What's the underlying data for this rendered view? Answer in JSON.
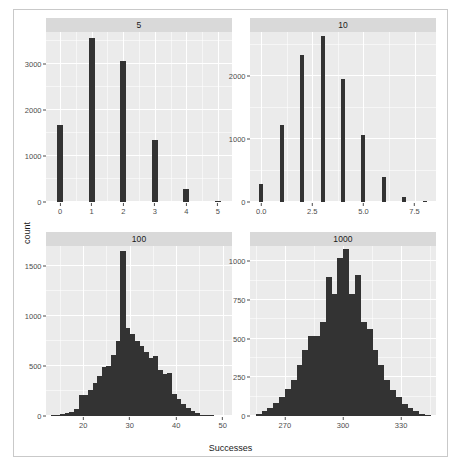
{
  "chart_data": {
    "type": "bar",
    "title": "",
    "xlabel": "Successes",
    "ylabel": "count",
    "grid": true,
    "legend": false,
    "facet_layout": "2x2",
    "facet_variable": "Trials",
    "panels": [
      {
        "strip_label": "5",
        "position": "top-left",
        "xlabel": "Successes",
        "ylabel": "count",
        "xlim": [
          -0.45,
          5.45
        ],
        "ylim": [
          0,
          3700
        ],
        "xticks": [
          "0",
          "1",
          "2",
          "3",
          "4",
          "5"
        ],
        "xtick_values": [
          0,
          1,
          2,
          3,
          4,
          5
        ],
        "yticks": [
          "0",
          "1000",
          "2000",
          "3000"
        ],
        "ytick_values": [
          0,
          1000,
          2000,
          3000
        ],
        "categories": [
          0,
          1,
          2,
          3,
          4,
          5
        ],
        "values": [
          1680,
          3570,
          3080,
          1340,
          290,
          25
        ]
      },
      {
        "strip_label": "10",
        "position": "top-right",
        "xlabel": "Successes",
        "ylabel": "count",
        "xlim": [
          -0.55,
          8.55
        ],
        "ylim": [
          0,
          2700
        ],
        "xticks": [
          "0.0",
          "2.5",
          "5.0",
          "7.5"
        ],
        "xtick_values": [
          0,
          2.5,
          5,
          7.5
        ],
        "yticks": [
          "0",
          "1000",
          "2000"
        ],
        "ytick_values": [
          0,
          1000,
          2000
        ],
        "categories": [
          0,
          1,
          2,
          3,
          4,
          5,
          6,
          7,
          8
        ],
        "values": [
          290,
          1230,
          2340,
          2630,
          1960,
          1060,
          400,
          80,
          15
        ]
      },
      {
        "strip_label": "100",
        "position": "bottom-left",
        "xlabel": "Successes",
        "ylabel": "count",
        "xlim": [
          12,
          52
        ],
        "ylim": [
          0,
          1700
        ],
        "xticks": [
          "20",
          "30",
          "40",
          "50"
        ],
        "xtick_values": [
          20,
          30,
          40,
          50
        ],
        "yticks": [
          "0",
          "500",
          "1000",
          "1500"
        ],
        "ytick_values": [
          0,
          500,
          1000,
          1500
        ],
        "bin_starts": [
          13,
          14,
          15,
          16,
          17,
          18,
          19,
          20,
          21,
          22,
          23,
          24,
          25,
          26,
          27,
          28,
          29,
          30,
          31,
          32,
          33,
          34,
          35,
          36,
          37,
          38,
          39,
          40,
          41,
          42,
          43,
          44,
          45,
          46,
          47
        ],
        "bin_width": 1,
        "values": [
          5,
          10,
          20,
          30,
          45,
          75,
          210,
          215,
          265,
          330,
          400,
          490,
          505,
          610,
          755,
          1650,
          880,
          820,
          755,
          700,
          640,
          580,
          600,
          460,
          420,
          430,
          225,
          175,
          120,
          80,
          55,
          30,
          15,
          8,
          4
        ]
      },
      {
        "strip_label": "1000",
        "position": "bottom-right",
        "xlabel": "Successes",
        "ylabel": "count",
        "xlim": [
          252,
          348
        ],
        "ylim": [
          0,
          1100
        ],
        "xticks": [
          "270",
          "300",
          "330"
        ],
        "xtick_values": [
          270,
          300,
          330
        ],
        "yticks": [
          "0",
          "250",
          "500",
          "750",
          "1000"
        ],
        "ytick_values": [
          0,
          250,
          500,
          750,
          1000
        ],
        "bin_starts": [
          255,
          258,
          261,
          264,
          267,
          270,
          273,
          276,
          279,
          282,
          285,
          288,
          291,
          294,
          297,
          300,
          303,
          306,
          309,
          312,
          315,
          318,
          321,
          324,
          327,
          330,
          333,
          336,
          339,
          342
        ],
        "bin_width": 3,
        "values": [
          15,
          30,
          55,
          85,
          120,
          175,
          230,
          330,
          430,
          520,
          520,
          610,
          900,
          790,
          1020,
          1080,
          790,
          910,
          610,
          560,
          430,
          330,
          235,
          170,
          120,
          80,
          50,
          30,
          15,
          8
        ]
      }
    ]
  },
  "colors": {
    "bar": "#333333",
    "panel_background": "#ebebeb",
    "strip_background": "#d9d9d9",
    "gridline": "#ffffff",
    "axis_text": "#4d4d4d",
    "title_text": "#1a1a1a",
    "figure_background": "#ffffff",
    "figure_border": "#c9c9c9"
  }
}
